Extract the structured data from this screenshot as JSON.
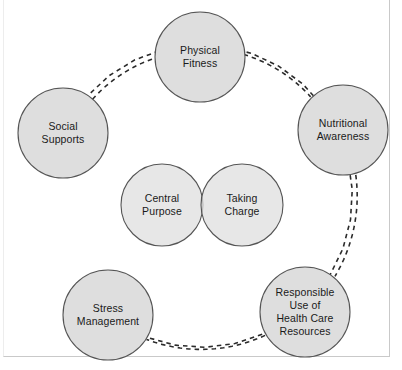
{
  "diagram": {
    "type": "wellness-wheel-venn",
    "background_color": "#ffffff",
    "circle_fill": "#dedede",
    "circle_stroke": "#555555",
    "connector_color": "#2b2b2b",
    "connector_style": "dashed",
    "text_color": "#1a1a1a",
    "frame_color": "#c9c9c9",
    "outer_nodes": [
      {
        "id": "physical-fitness",
        "lines": [
          "Physical",
          "Fitness"
        ],
        "cx": 200,
        "cy": 57,
        "r": 45
      },
      {
        "id": "nutritional-awareness",
        "lines": [
          "Nutritional",
          "Awareness"
        ],
        "cx": 343,
        "cy": 130,
        "r": 45
      },
      {
        "id": "responsible-use-of-health-care-resources",
        "lines": [
          "Responsible",
          "Use of",
          "Health Care",
          "Resources"
        ],
        "cx": 305,
        "cy": 312,
        "r": 45
      },
      {
        "id": "stress-management",
        "lines": [
          "Stress",
          "Management"
        ],
        "cx": 108,
        "cy": 315,
        "r": 45
      },
      {
        "id": "social-supports",
        "lines": [
          "Social",
          "Supports"
        ],
        "cx": 63,
        "cy": 133,
        "r": 45
      }
    ],
    "center_nodes": [
      {
        "id": "central-purpose",
        "lines": [
          "Central",
          "Purpose"
        ],
        "cx": 162,
        "cy": 205,
        "r": 41
      },
      {
        "id": "taking-charge",
        "lines": [
          "Taking",
          "Charge"
        ],
        "cx": 242,
        "cy": 205,
        "r": 41
      }
    ],
    "connectors": [
      {
        "id": "social-supports-to-physical-fitness",
        "from": "social-supports",
        "to": "physical-fitness"
      },
      {
        "id": "physical-fitness-to-nutritional-awareness",
        "from": "physical-fitness",
        "to": "nutritional-awareness"
      },
      {
        "id": "nutritional-awareness-to-responsible-use",
        "from": "nutritional-awareness",
        "to": "responsible-use-of-health-care-resources"
      },
      {
        "id": "responsible-use-to-stress-management",
        "from": "responsible-use-of-health-care-resources",
        "to": "stress-management"
      },
      {
        "id": "stress-management-to-social-supports",
        "from": "stress-management",
        "to": "social-supports"
      }
    ]
  }
}
